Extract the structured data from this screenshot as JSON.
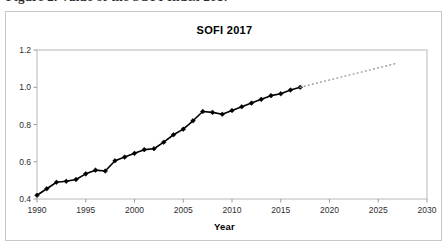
{
  "figure": {
    "caption_sliver": "Figure 2. Value of the SOFI Index 2017",
    "frame_border_color": "#c9c9c9",
    "background_color": "#ffffff"
  },
  "chart_data": {
    "type": "line",
    "title": "SOFI 2017",
    "xlabel": "Year",
    "ylabel": "",
    "xlim": [
      1990,
      2030
    ],
    "ylim": [
      0.4,
      1.2
    ],
    "grid": false,
    "legend_position": "none",
    "x_ticks": [
      1990,
      1995,
      2000,
      2005,
      2010,
      2015,
      2020,
      2025,
      2030
    ],
    "y_ticks": [
      0.4,
      0.6,
      0.8,
      1.0,
      1.2
    ],
    "y_tick_labels": [
      "0.4",
      "0.6",
      "0.8",
      "1.0",
      "1.2"
    ],
    "x_tick_labels": [
      "1990",
      "1995",
      "2000",
      "2005",
      "2010",
      "2015",
      "2020",
      "2025",
      "2030"
    ],
    "series": [
      {
        "name": "SOFI Index (observed)",
        "style": "solid",
        "color": "#000000",
        "marker": "diamond",
        "x": [
          1990,
          1991,
          1992,
          1993,
          1994,
          1995,
          1996,
          1997,
          1998,
          1999,
          2000,
          2001,
          2002,
          2003,
          2004,
          2005,
          2006,
          2007,
          2008,
          2009,
          2010,
          2011,
          2012,
          2013,
          2014,
          2015,
          2016,
          2017
        ],
        "values": [
          0.42,
          0.455,
          0.49,
          0.495,
          0.505,
          0.535,
          0.555,
          0.55,
          0.605,
          0.625,
          0.645,
          0.665,
          0.67,
          0.705,
          0.745,
          0.775,
          0.82,
          0.87,
          0.865,
          0.855,
          0.875,
          0.895,
          0.915,
          0.935,
          0.955,
          0.965,
          0.985,
          1.0
        ]
      },
      {
        "name": "SOFI Index (projection)",
        "style": "dotted",
        "color": "#9a9a9a",
        "marker": "none",
        "x": [
          2017,
          2018,
          2019,
          2020,
          2021,
          2022,
          2023,
          2024,
          2025,
          2026,
          2027
        ],
        "values": [
          1.0,
          1.013,
          1.026,
          1.039,
          1.052,
          1.065,
          1.078,
          1.091,
          1.104,
          1.117,
          1.13
        ]
      }
    ]
  }
}
